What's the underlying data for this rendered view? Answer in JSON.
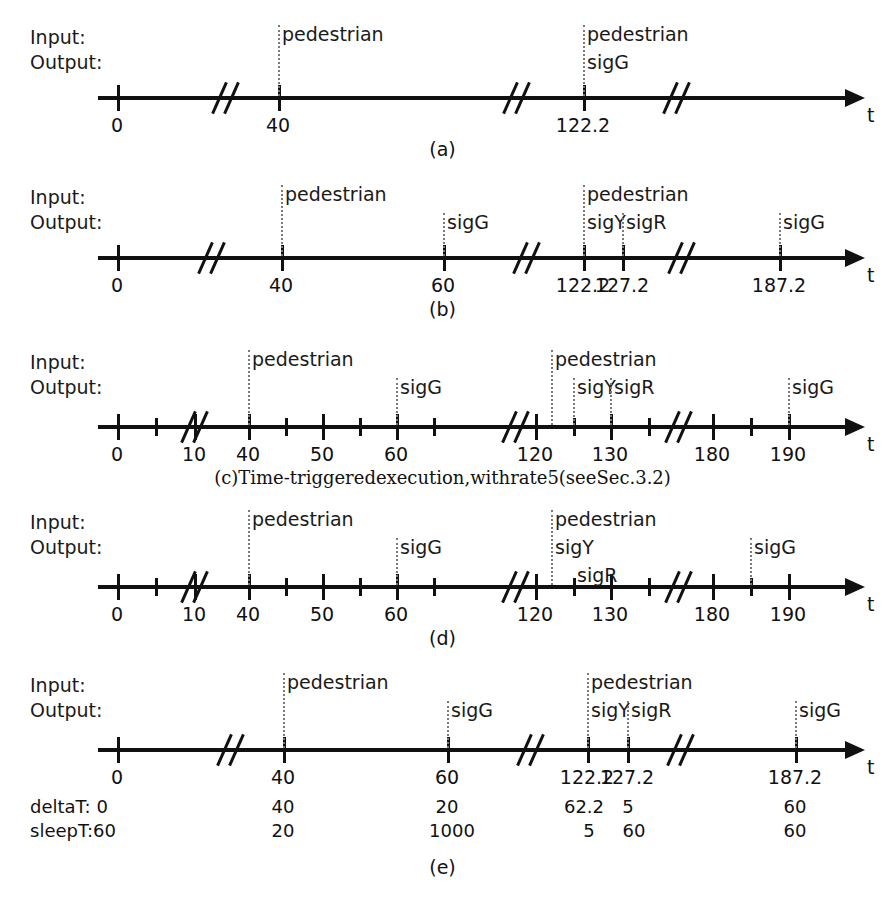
{
  "figure": {
    "io_labels": {
      "input": "Input:",
      "output": "Output:"
    },
    "axis_label": "t"
  },
  "panels": [
    {
      "id": "a",
      "caption": "(a)",
      "top": 20,
      "axis": {
        "y": 96,
        "x_start": 98,
        "x_end": 845
      },
      "breaks": [
        227,
        518,
        678
      ],
      "ticks": [
        {
          "x": 117,
          "type": "major",
          "label": "0"
        },
        {
          "x": 278,
          "type": "major",
          "label": "40"
        },
        {
          "x": 583,
          "type": "major",
          "label": "122.2"
        }
      ],
      "events": [
        {
          "x": 278,
          "dotted": true,
          "rows": [
            {
              "row": 0,
              "text": "pedestrian"
            }
          ]
        },
        {
          "x": 583,
          "dotted": true,
          "rows": [
            {
              "row": 0,
              "text": "pedestrian"
            },
            {
              "row": 1,
              "text": "sigG"
            }
          ]
        }
      ]
    },
    {
      "id": "b",
      "caption": "(b)",
      "top": 180,
      "axis": {
        "y": 256,
        "x_start": 98,
        "x_end": 845
      },
      "breaks": [
        213,
        528,
        683
      ],
      "ticks": [
        {
          "x": 117,
          "type": "major",
          "label": "0"
        },
        {
          "x": 281,
          "type": "major",
          "label": "40"
        },
        {
          "x": 443,
          "type": "major",
          "label": "60"
        },
        {
          "x": 583,
          "type": "major",
          "label": "122.2"
        },
        {
          "x": 622,
          "type": "major",
          "label": "127.2"
        },
        {
          "x": 779,
          "type": "major",
          "label": "187.2"
        }
      ],
      "events": [
        {
          "x": 281,
          "dotted": true,
          "rows": [
            {
              "row": 0,
              "text": "pedestrian"
            }
          ]
        },
        {
          "x": 443,
          "dotted": true,
          "rows": [
            {
              "row": 1,
              "text": "sigG"
            }
          ]
        },
        {
          "x": 583,
          "dotted": true,
          "rows": [
            {
              "row": 0,
              "text": "pedestrian"
            },
            {
              "row": 1,
              "text": "sigY"
            }
          ]
        },
        {
          "x": 622,
          "dotted": true,
          "rows": [
            {
              "row": 1,
              "text": "sigR"
            }
          ]
        },
        {
          "x": 779,
          "dotted": true,
          "rows": [
            {
              "row": 1,
              "text": "sigG"
            }
          ]
        }
      ]
    },
    {
      "id": "c",
      "caption": "(c)Time-triggeredexecution,withrate5(seeSec.3.2)",
      "caption_serif": true,
      "top": 345,
      "axis": {
        "y": 425,
        "x_start": 98,
        "x_end": 845
      },
      "breaks": [
        196,
        517,
        680
      ],
      "ticks": [
        {
          "x": 117,
          "type": "major",
          "label": "0"
        },
        {
          "x": 155,
          "type": "minor",
          "label": ""
        },
        {
          "x": 194,
          "type": "major",
          "label": "10"
        },
        {
          "x": 248,
          "type": "major",
          "label": "40"
        },
        {
          "x": 285,
          "type": "minor",
          "label": ""
        },
        {
          "x": 322,
          "type": "major",
          "label": "50"
        },
        {
          "x": 359,
          "type": "minor",
          "label": ""
        },
        {
          "x": 396,
          "type": "major",
          "label": "60"
        },
        {
          "x": 433,
          "type": "minor",
          "label": ""
        },
        {
          "x": 535,
          "type": "major",
          "label": "120"
        },
        {
          "x": 573,
          "type": "minor",
          "label": ""
        },
        {
          "x": 610,
          "type": "major",
          "label": "130"
        },
        {
          "x": 648,
          "type": "minor",
          "label": ""
        },
        {
          "x": 712,
          "type": "major",
          "label": "180"
        },
        {
          "x": 750,
          "type": "minor",
          "label": ""
        },
        {
          "x": 788,
          "type": "major",
          "label": "190"
        }
      ],
      "events": [
        {
          "x": 248,
          "dotted": true,
          "rows": [
            {
              "row": 0,
              "text": "pedestrian"
            }
          ]
        },
        {
          "x": 396,
          "dotted": true,
          "rows": [
            {
              "row": 1,
              "text": "sigG"
            }
          ]
        },
        {
          "x": 551,
          "dotted": true,
          "rows": [
            {
              "row": 0,
              "text": "pedestrian"
            }
          ]
        },
        {
          "x": 573,
          "dotted": true,
          "rows": [
            {
              "row": 1,
              "text": "sigY"
            }
          ]
        },
        {
          "x": 610,
          "dotted": true,
          "rows": [
            {
              "row": 1,
              "text": "sigR"
            }
          ]
        },
        {
          "x": 788,
          "dotted": true,
          "rows": [
            {
              "row": 1,
              "text": "sigG"
            }
          ]
        }
      ]
    },
    {
      "id": "d",
      "caption": "(d)",
      "top": 505,
      "axis": {
        "y": 585,
        "x_start": 98,
        "x_end": 845
      },
      "breaks": [
        196,
        517,
        680
      ],
      "ticks": [
        {
          "x": 117,
          "type": "major",
          "label": "0"
        },
        {
          "x": 155,
          "type": "minor",
          "label": ""
        },
        {
          "x": 194,
          "type": "major",
          "label": "10"
        },
        {
          "x": 248,
          "type": "major",
          "label": "40"
        },
        {
          "x": 285,
          "type": "minor",
          "label": ""
        },
        {
          "x": 322,
          "type": "major",
          "label": "50"
        },
        {
          "x": 359,
          "type": "minor",
          "label": ""
        },
        {
          "x": 396,
          "type": "major",
          "label": "60"
        },
        {
          "x": 433,
          "type": "minor",
          "label": ""
        },
        {
          "x": 535,
          "type": "major",
          "label": "120"
        },
        {
          "x": 573,
          "type": "minor",
          "label": ""
        },
        {
          "x": 610,
          "type": "major",
          "label": "130"
        },
        {
          "x": 648,
          "type": "minor",
          "label": ""
        },
        {
          "x": 712,
          "type": "major",
          "label": "180"
        },
        {
          "x": 750,
          "type": "minor",
          "label": ""
        },
        {
          "x": 788,
          "type": "major",
          "label": "190"
        }
      ],
      "events": [
        {
          "x": 248,
          "dotted": true,
          "rows": [
            {
              "row": 0,
              "text": "pedestrian"
            }
          ]
        },
        {
          "x": 396,
          "dotted": true,
          "rows": [
            {
              "row": 1,
              "text": "sigG"
            }
          ]
        },
        {
          "x": 551,
          "dotted": true,
          "rows": [
            {
              "row": 0,
              "text": "pedestrian"
            },
            {
              "row": 1,
              "text": "sigY"
            }
          ]
        },
        {
          "x": 573,
          "dotted": false,
          "rows": [
            {
              "row": 2,
              "text": "sigR"
            }
          ]
        },
        {
          "x": 750,
          "dotted": true,
          "rows": [
            {
              "row": 1,
              "text": "sigG"
            }
          ]
        }
      ]
    },
    {
      "id": "e",
      "caption": "(e)",
      "top": 668,
      "axis": {
        "y": 748,
        "x_start": 98,
        "x_end": 845
      },
      "breaks": [
        232,
        532,
        682
      ],
      "ticks": [
        {
          "x": 117,
          "type": "major",
          "label": "0"
        },
        {
          "x": 283,
          "type": "major",
          "label": "40"
        },
        {
          "x": 447,
          "type": "major",
          "label": "60"
        },
        {
          "x": 587,
          "type": "major",
          "label": "122.2"
        },
        {
          "x": 627,
          "type": "major",
          "label": "127.2"
        },
        {
          "x": 795,
          "type": "major",
          "label": "187.2"
        }
      ],
      "events": [
        {
          "x": 283,
          "dotted": true,
          "rows": [
            {
              "row": 0,
              "text": "pedestrian"
            }
          ]
        },
        {
          "x": 447,
          "dotted": true,
          "rows": [
            {
              "row": 1,
              "text": "sigG"
            }
          ]
        },
        {
          "x": 587,
          "dotted": true,
          "rows": [
            {
              "row": 0,
              "text": "pedestrian"
            },
            {
              "row": 1,
              "text": "sigY"
            }
          ]
        },
        {
          "x": 627,
          "dotted": true,
          "rows": [
            {
              "row": 1,
              "text": "sigR"
            }
          ]
        },
        {
          "x": 795,
          "dotted": true,
          "rows": [
            {
              "row": 1,
              "text": "sigG"
            }
          ]
        }
      ],
      "timing_rows": {
        "delta_label": "deltaT: 0",
        "sleep_label": "sleepT:60",
        "delta_values": [
          {
            "x": 283,
            "text": "40"
          },
          {
            "x": 447,
            "text": "20"
          },
          {
            "x": 584,
            "text": "62.2"
          },
          {
            "x": 628,
            "text": "5"
          },
          {
            "x": 795,
            "text": "60"
          }
        ],
        "sleep_values": [
          {
            "x": 283,
            "text": "20"
          },
          {
            "x": 452,
            "text": "1000"
          },
          {
            "x": 589,
            "text": "5"
          },
          {
            "x": 634,
            "text": "60"
          },
          {
            "x": 795,
            "text": "60"
          }
        ]
      }
    }
  ]
}
